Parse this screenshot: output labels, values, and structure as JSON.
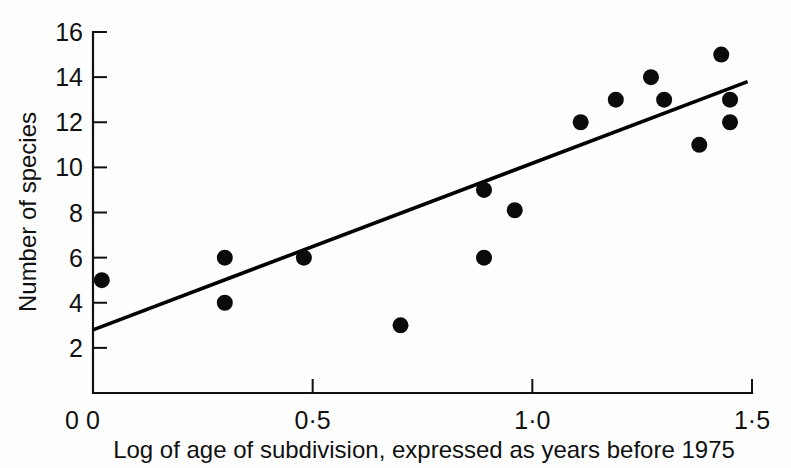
{
  "chart_data": {
    "type": "scatter",
    "title": "",
    "xlabel": "Log of age of subdivision, expressed as years before 1975",
    "ylabel": "Number of species",
    "xlim": [
      0,
      1.5
    ],
    "ylim": [
      0,
      16
    ],
    "grid": false,
    "legend": "none",
    "x_ticks": [
      0,
      0.5,
      1.0,
      1.5
    ],
    "x_tick_labels": [
      "0",
      "0·5",
      "1·0",
      "1·5"
    ],
    "y_ticks": [
      0,
      2,
      4,
      6,
      8,
      10,
      12,
      14,
      16
    ],
    "y_tick_labels": [
      "0",
      "2",
      "4",
      "6",
      "8",
      "10",
      "12",
      "14",
      "16"
    ],
    "points": [
      {
        "x": 0.02,
        "y": 5
      },
      {
        "x": 0.3,
        "y": 6
      },
      {
        "x": 0.3,
        "y": 4
      },
      {
        "x": 0.48,
        "y": 6
      },
      {
        "x": 0.7,
        "y": 3
      },
      {
        "x": 0.89,
        "y": 9
      },
      {
        "x": 0.89,
        "y": 6
      },
      {
        "x": 0.96,
        "y": 8.1
      },
      {
        "x": 1.11,
        "y": 12
      },
      {
        "x": 1.19,
        "y": 13
      },
      {
        "x": 1.27,
        "y": 14
      },
      {
        "x": 1.3,
        "y": 13
      },
      {
        "x": 1.38,
        "y": 11
      },
      {
        "x": 1.43,
        "y": 15
      },
      {
        "x": 1.45,
        "y": 13
      },
      {
        "x": 1.45,
        "y": 12
      }
    ],
    "point_marker": "filled-circle",
    "point_radius": 8,
    "fit_line": {
      "type": "linear-regression",
      "x_start": 0.0,
      "y_start": 2.8,
      "x_end": 1.49,
      "y_end": 13.8
    },
    "colors": {
      "point": "#0b0b0b",
      "line": "#000000",
      "axis": "#111111",
      "background": "#fefefe"
    }
  }
}
